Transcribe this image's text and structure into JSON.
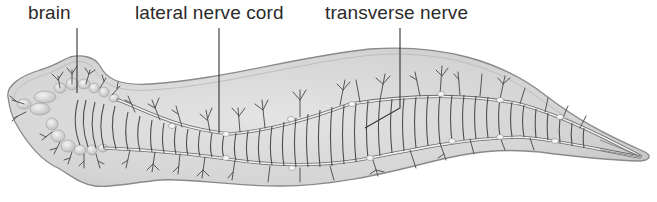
{
  "figure": {
    "labels": [
      {
        "id": "brain",
        "text": "brain",
        "x": 28,
        "line_x": 77,
        "line_end_y": 93
      },
      {
        "id": "lateral-nerve-cord",
        "text": "lateral nerve cord",
        "x": 135,
        "line_x": 219,
        "line_end_y": 133
      },
      {
        "id": "transverse-nerve",
        "text": "transverse nerve",
        "x": 325,
        "line_x": 400,
        "line_end_y": 108
      }
    ],
    "colors": {
      "body_fill": "#d9d9d9",
      "body_outline": "#8a8a8a",
      "nerve": "#555555",
      "cord": "#f2f2f2",
      "label": "#2a2a2a",
      "leader": "#333333"
    }
  }
}
